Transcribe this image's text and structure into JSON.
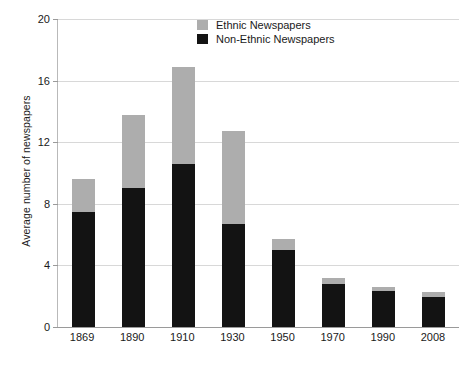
{
  "chart_data": {
    "type": "bar",
    "stacked": true,
    "title": "",
    "xlabel": "",
    "ylabel": "Average number of newspapers",
    "ylim": [
      0,
      20
    ],
    "yticks": [
      0,
      4,
      8,
      12,
      16,
      20
    ],
    "ytick_labels": [
      "0",
      "4",
      "8",
      "12",
      "16",
      "20"
    ],
    "grid": true,
    "legend_position": "top-center",
    "categories": [
      "1869",
      "1890",
      "1910",
      "1930",
      "1950",
      "1970",
      "1990",
      "2008"
    ],
    "series": [
      {
        "name": "Non-Ethnic Newspapers",
        "color": "#131313",
        "values": [
          7.5,
          9.0,
          10.6,
          6.7,
          5.0,
          2.8,
          2.35,
          1.95
        ]
      },
      {
        "name": "Ethnic Newspapers",
        "color": "#adadad",
        "values": [
          2.1,
          4.8,
          6.3,
          6.0,
          0.7,
          0.4,
          0.25,
          0.3
        ]
      }
    ],
    "totals": [
      9.6,
      13.8,
      16.9,
      12.7,
      5.7,
      3.2,
      2.6,
      2.25
    ]
  },
  "legend": {
    "items": [
      {
        "label": "Ethnic Newspapers",
        "color": "#adadad"
      },
      {
        "label": "Non-Ethnic Newspapers",
        "color": "#131313"
      }
    ]
  },
  "axes": {
    "y_title": "Average number of newspapers"
  }
}
